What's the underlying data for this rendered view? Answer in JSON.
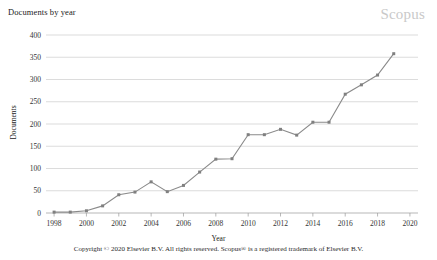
{
  "chart_data": {
    "type": "line",
    "title": "Documents by year",
    "xlabel": "Year",
    "ylabel": "Documents",
    "xlim": [
      1997.5,
      2020.5
    ],
    "ylim": [
      0,
      400
    ],
    "grid": true,
    "legend": null,
    "watermark": "Scopus",
    "x": [
      1998,
      1999,
      2000,
      2001,
      2002,
      2003,
      2004,
      2005,
      2006,
      2007,
      2008,
      2009,
      2010,
      2011,
      2012,
      2013,
      2014,
      2015,
      2016,
      2017,
      2018,
      2019
    ],
    "values": [
      2,
      2,
      5,
      16,
      41,
      47,
      70,
      48,
      62,
      92,
      121,
      122,
      176,
      176,
      188,
      175,
      204,
      204,
      267,
      288,
      310,
      358
    ],
    "series": [
      {
        "name": "Documents",
        "values": [
          2,
          2,
          5,
          16,
          41,
          47,
          70,
          48,
          62,
          92,
          121,
          122,
          176,
          176,
          188,
          175,
          204,
          204,
          267,
          288,
          310,
          358
        ]
      }
    ],
    "ytick_labels": [
      "0",
      "50",
      "100",
      "150",
      "200",
      "250",
      "300",
      "350",
      "400"
    ],
    "ytick_values": [
      0,
      50,
      100,
      150,
      200,
      250,
      300,
      350,
      400
    ],
    "xtick_labels": [
      "1998",
      "2000",
      "2002",
      "2004",
      "2006",
      "2008",
      "2010",
      "2012",
      "2014",
      "2016",
      "2018",
      "2020"
    ],
    "xtick_values": [
      1998,
      2000,
      2002,
      2004,
      2006,
      2008,
      2010,
      2012,
      2014,
      2016,
      2018,
      2020
    ],
    "colors": {
      "line": "#8a8a8a",
      "marker": "#808080",
      "grid": "#c4c4c4",
      "axis": "#9a9a9a",
      "watermark": "#c9c9c9",
      "text": "#222222"
    }
  },
  "footer": {
    "copyright": "Copyright © 2020 Elsevier B.V. All rights reserved. Scopus® is a registered trademark of Elsevier B.V."
  }
}
